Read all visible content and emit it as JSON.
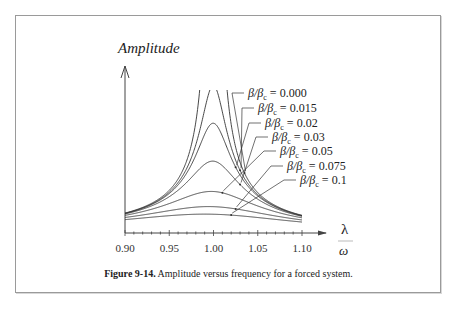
{
  "chart_data": {
    "type": "line",
    "title": "",
    "xlabel": "λ / ω",
    "ylabel": "Amplitude",
    "x_ticks": [
      "0.90",
      "0.95",
      "1.00",
      "1.05",
      "1.10"
    ],
    "xlim": [
      0.9,
      1.1
    ],
    "grid": false,
    "legend_position": "annotations upper right with leader arrows",
    "series": [
      {
        "name": "β/βc = 0.000",
        "damping": 0.0,
        "peak": "unbounded"
      },
      {
        "name": "β/βc = 0.015",
        "damping": 0.015,
        "peak_amplitude": 33.3
      },
      {
        "name": "β/βc = 0.02",
        "damping": 0.02,
        "peak_amplitude": 25.0
      },
      {
        "name": "β/βc = 0.03",
        "damping": 0.03,
        "peak_amplitude": 16.7
      },
      {
        "name": "β/βc = 0.05",
        "damping": 0.05,
        "peak_amplitude": 10.0
      },
      {
        "name": "β/βc = 0.075",
        "damping": 0.075,
        "peak_amplitude": 6.7
      },
      {
        "name": "β/βc = 0.1",
        "damping": 0.1,
        "peak_amplitude": 5.0
      }
    ]
  },
  "labels": {
    "amplitude": "Amplitude",
    "lambda": "λ",
    "omega": "ω",
    "legend": [
      {
        "lhs": "β/β",
        "sub": "c",
        "rhs": " = 0.000"
      },
      {
        "lhs": "β/β",
        "sub": "c",
        "rhs": " = 0.015"
      },
      {
        "lhs": "β/β",
        "sub": "c",
        "rhs": " = 0.02"
      },
      {
        "lhs": "β/β",
        "sub": "c",
        "rhs": " = 0.03"
      },
      {
        "lhs": "β/β",
        "sub": "c",
        "rhs": " = 0.05"
      },
      {
        "lhs": "β/β",
        "sub": "c",
        "rhs": " = 0.075"
      },
      {
        "lhs": "β/β",
        "sub": "c",
        "rhs": " = 0.1"
      }
    ]
  },
  "caption": {
    "label": "Figure 9-14.",
    "text": " Amplitude versus frequency for a forced system."
  }
}
